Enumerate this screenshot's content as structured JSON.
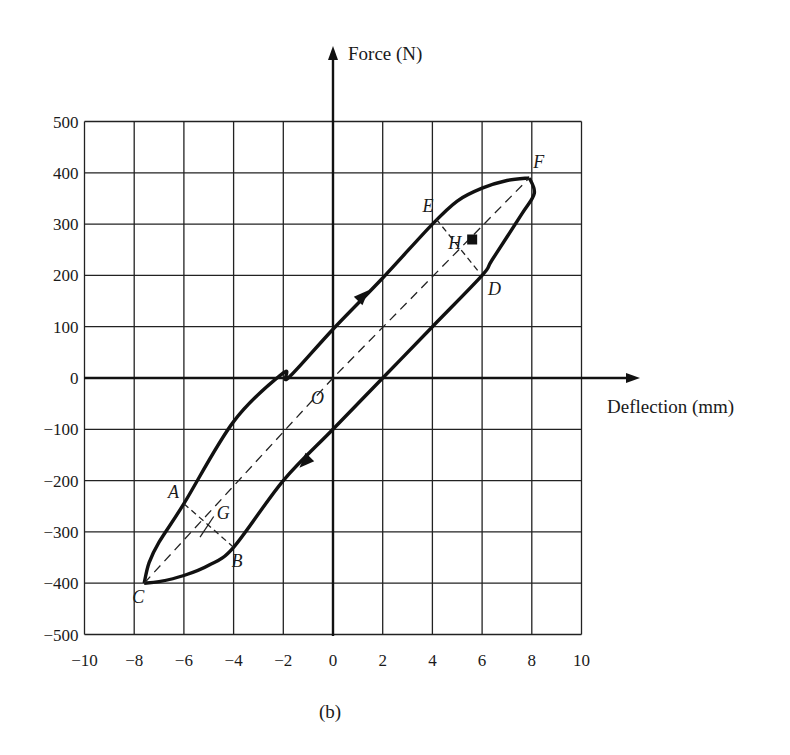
{
  "chart_data": {
    "type": "line",
    "title": "",
    "caption": "(b)",
    "xlabel": "Deflection (mm)",
    "ylabel": "Force (N)",
    "xlim": [
      -10,
      10
    ],
    "ylim": [
      -500,
      500
    ],
    "grid": true,
    "x_ticks": [
      -10,
      -8,
      -6,
      -4,
      -2,
      0,
      2,
      4,
      6,
      8,
      10
    ],
    "y_ticks": [
      500,
      400,
      300,
      200,
      100,
      0,
      -100,
      -200,
      -300,
      -400,
      -500
    ],
    "x_tick_labels": [
      "−10",
      "−8",
      "−6",
      "−4",
      "−2",
      "0",
      "2",
      "4",
      "6",
      "8",
      "10"
    ],
    "y_tick_labels": [
      "500",
      "400",
      "300",
      "200",
      "100",
      "0",
      "−100",
      "−200",
      "−300",
      "−400",
      "−500"
    ],
    "series": [
      {
        "name": "Loading branch (C to F, upper)",
        "direction": "up",
        "points": [
          [
            -7.6,
            -400
          ],
          [
            -7.4,
            -360
          ],
          [
            -7.0,
            -320
          ],
          [
            -6.0,
            -245
          ],
          [
            -4.0,
            -85
          ],
          [
            -2.0,
            10
          ],
          [
            -1.8,
            0
          ],
          [
            0,
            95
          ],
          [
            2.0,
            195
          ],
          [
            4.0,
            300
          ],
          [
            5.0,
            345
          ],
          [
            6.0,
            370
          ],
          [
            7.0,
            385
          ],
          [
            7.9,
            390
          ]
        ]
      },
      {
        "name": "Unloading branch (F to C, lower)",
        "direction": "down",
        "points": [
          [
            7.9,
            390
          ],
          [
            8.1,
            360
          ],
          [
            7.6,
            320
          ],
          [
            6.4,
            230
          ],
          [
            6.0,
            200
          ],
          [
            4.0,
            100
          ],
          [
            2.0,
            0
          ],
          [
            0,
            -100
          ],
          [
            -2.0,
            -200
          ],
          [
            -4.0,
            -330
          ],
          [
            -5.0,
            -365
          ],
          [
            -6.0,
            -385
          ],
          [
            -7.0,
            -397
          ],
          [
            -7.6,
            -400
          ]
        ]
      },
      {
        "name": "Dashed diagonal C-F",
        "style": "dashed",
        "points": [
          [
            -7.6,
            -400
          ],
          [
            0,
            0
          ],
          [
            7.9,
            390
          ]
        ]
      }
    ],
    "annotations": [
      {
        "label": "O",
        "x": 0,
        "y": 0
      },
      {
        "label": "A",
        "x": -6.0,
        "y": -245
      },
      {
        "label": "B",
        "x": -4.0,
        "y": -330
      },
      {
        "label": "C",
        "x": -7.6,
        "y": -400
      },
      {
        "label": "D",
        "x": 6.0,
        "y": 200
      },
      {
        "label": "E",
        "x": 4.0,
        "y": 300
      },
      {
        "label": "F",
        "x": 7.9,
        "y": 390
      },
      {
        "label": "G",
        "x": -5.0,
        "y": -290
      },
      {
        "label": "H",
        "x": 5.6,
        "y": 270,
        "marker": "filled-square"
      }
    ]
  }
}
